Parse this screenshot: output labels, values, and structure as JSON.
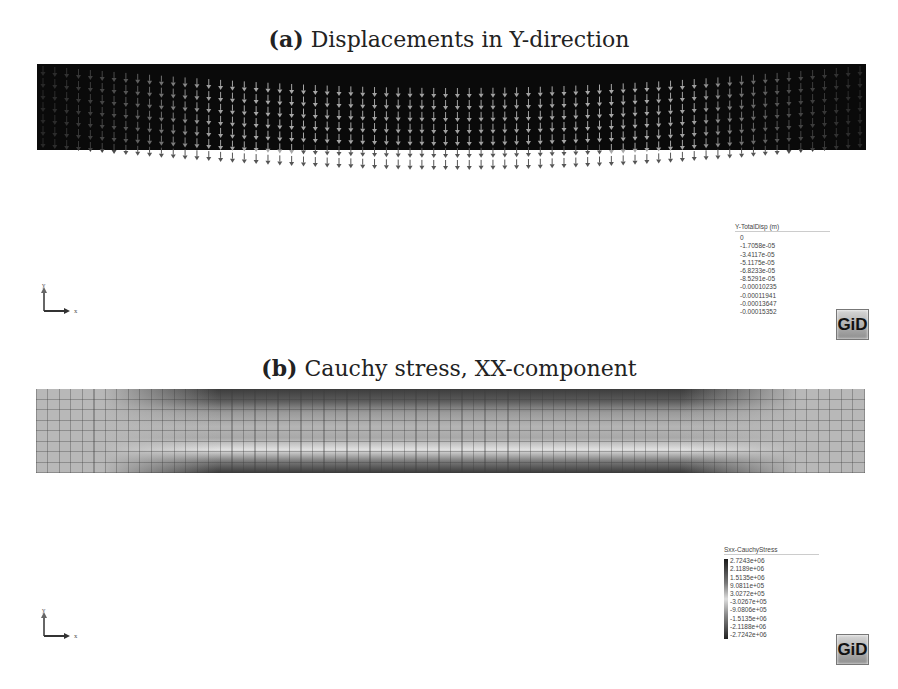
{
  "panel_a": {
    "label": "(a)",
    "title": "Displacements in Y-direction",
    "legend": {
      "title": "Y-TotalDisp (m)",
      "values": [
        "0",
        "-1.7058e-05",
        "-3.4117e-05",
        "-5.1175e-05",
        "-6.8233e-05",
        "-8.5291e-05",
        "-0.00010235",
        "-0.00011941",
        "-0.00013647",
        "-0.00015352"
      ]
    },
    "axes": {
      "y": "y",
      "x": "x"
    },
    "logo": "GiD"
  },
  "panel_b": {
    "label": "(b)",
    "title": "Cauchy stress, XX-component",
    "legend": {
      "title": "Sxx-CauchyStress",
      "values": [
        "2.7243e+06",
        "2.1189e+06",
        "1.5135e+06",
        "9.0811e+05",
        "3.0272e+05",
        "-3.0267e+05",
        "-9.0806e+05",
        "-1.5135e+06",
        "-2.1188e+06",
        "-2.7242e+06"
      ]
    },
    "axes": {
      "y": "y",
      "x": "x"
    },
    "logo": "GiD"
  }
}
